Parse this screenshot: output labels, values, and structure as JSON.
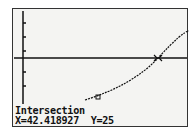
{
  "screen": {
    "title_label": "Intersection",
    "result": {
      "x_label": "X=42.418927",
      "y_label": "Y=25"
    }
  },
  "graph": {
    "intersection": {
      "x": 42.418927,
      "y": 25
    },
    "horizontal_line_y": 25,
    "curve": "increasing concave-up curve crossing horizontal line",
    "colors": {
      "background": "#f4f4f2",
      "ink": "#111111"
    }
  }
}
